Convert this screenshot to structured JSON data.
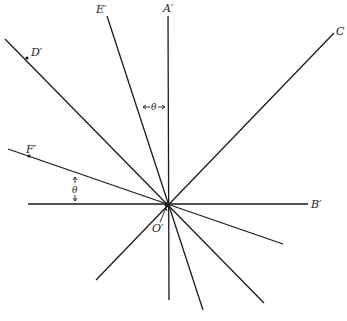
{
  "diagram": {
    "type": "ray-diagram",
    "origin": {
      "label": "O'",
      "x": 167,
      "y": 205
    },
    "angle_symbol": "θ",
    "rays": [
      {
        "name": "A'",
        "label": "A'",
        "end": [
          168,
          16
        ],
        "label_pos": [
          163,
          12
        ]
      },
      {
        "name": "B'",
        "label": "B'",
        "end": [
          308,
          204
        ],
        "label_pos": [
          311,
          208
        ]
      },
      {
        "name": "C",
        "label": "C",
        "end": [
          334,
          33
        ],
        "label_pos": [
          336,
          35
        ]
      },
      {
        "name": "D'",
        "label": "D'",
        "end": [
          5,
          39
        ],
        "label_pos": [
          31,
          56
        ]
      },
      {
        "name": "E'",
        "label": "E'",
        "end": [
          107,
          16
        ],
        "label_pos": [
          96,
          13
        ]
      },
      {
        "name": "F'",
        "label": "F'",
        "end": [
          8,
          149
        ],
        "label_pos": [
          26,
          153
        ]
      }
    ],
    "extensions": [
      {
        "name": "B'-left",
        "end": [
          28,
          204
        ]
      },
      {
        "name": "A'-down",
        "end": [
          169,
          300
        ]
      },
      {
        "name": "E'-down",
        "end": [
          203,
          310
        ]
      },
      {
        "name": "C-down",
        "end": [
          96,
          280
        ]
      },
      {
        "name": "D'-down",
        "end": [
          264,
          303
        ]
      },
      {
        "name": "F'-down",
        "end": [
          283,
          244
        ]
      }
    ],
    "labels": {
      "A": "A′",
      "B": "B′",
      "C": "C",
      "D": "D′",
      "E": "E′",
      "F": "F′",
      "O": "O′",
      "theta_top": "θ",
      "theta_left": "θ"
    }
  }
}
